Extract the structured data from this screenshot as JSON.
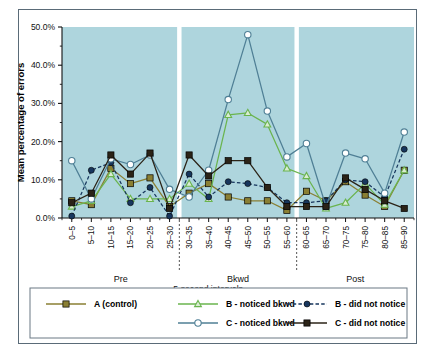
{
  "figure": {
    "border_color": "#5a6b78",
    "plot_background": "#aed5dd"
  },
  "chart_data": {
    "type": "line",
    "title": "",
    "xlabel": "5-second intervals",
    "ylabel": "Mean percentage of errors",
    "ylim": [
      0,
      50
    ],
    "ytick_labels": [
      "0.0%",
      "10.0%",
      "20.0%",
      "30.0%",
      "40.0%",
      "50.0%"
    ],
    "ytick_values": [
      0,
      10,
      20,
      30,
      40,
      50
    ],
    "grid": false,
    "legend_position": "bottom",
    "categories": [
      "0–5",
      "5–10",
      "10–15",
      "15–20",
      "20–25",
      "25–30",
      "30–35",
      "35–40",
      "40–45",
      "45–50",
      "50–55",
      "55–60",
      "60–65",
      "65–70",
      "70–75",
      "75–80",
      "80–85",
      "85–90"
    ],
    "phases": [
      {
        "label": "Pre",
        "start_index": 0,
        "end_index": 5
      },
      {
        "label": "Bkwd",
        "start_index": 6,
        "end_index": 11
      },
      {
        "label": "Post",
        "start_index": 12,
        "end_index": 17
      }
    ],
    "phase_dividers_after_index": [
      5,
      11
    ],
    "series": [
      {
        "name": "A (control)",
        "color": "#8a7f33",
        "marker": "square-filled",
        "dash": "solid",
        "values": [
          4.5,
          3.5,
          13.0,
          9.0,
          10.5,
          3.0,
          6.5,
          9.0,
          5.5,
          4.5,
          4.5,
          2.0,
          7.0,
          4.5,
          9.5,
          6.0,
          3.0,
          12.5
        ]
      },
      {
        "name": "B - noticed bkwd",
        "color": "#6ab44e",
        "marker": "triangle-open",
        "dash": "solid",
        "values": [
          3.0,
          4.5,
          11.5,
          5.0,
          5.0,
          5.0,
          9.0,
          5.0,
          27.0,
          27.5,
          24.5,
          13.0,
          11.0,
          2.5,
          4.0,
          9.0,
          3.5,
          12.5
        ]
      },
      {
        "name": "B - did not notice",
        "color": "#17365d",
        "marker": "circle-filled",
        "dash": "dashed",
        "values": [
          0.5,
          12.5,
          14.5,
          4.0,
          8.0,
          0.5,
          11.5,
          5.5,
          9.5,
          9.0,
          8.0,
          4.0,
          4.0,
          4.5,
          10.0,
          9.5,
          5.5,
          18.0
        ]
      },
      {
        "name": "C - noticed bkwd",
        "color": "#4f7f95",
        "marker": "circle-open",
        "dash": "solid",
        "values": [
          15.0,
          5.0,
          15.5,
          14.0,
          16.5,
          7.5,
          5.5,
          12.5,
          31.0,
          48.0,
          28.0,
          16.0,
          19.5,
          3.0,
          17.0,
          15.5,
          6.5,
          22.5
        ]
      },
      {
        "name": "C - did not notice",
        "color": "#2b2317",
        "marker": "square-filled",
        "dash": "solid",
        "values": [
          4.0,
          6.5,
          16.5,
          11.5,
          17.0,
          2.5,
          16.5,
          11.0,
          15.0,
          15.0,
          8.0,
          3.0,
          3.0,
          3.0,
          10.5,
          7.5,
          4.5,
          2.5
        ]
      }
    ]
  },
  "legend": {
    "rows": [
      [
        "A (control)",
        "B - noticed bkwd",
        "B - did not notice"
      ],
      [
        "",
        "C - noticed bkwd",
        "C - did not notice"
      ]
    ]
  }
}
